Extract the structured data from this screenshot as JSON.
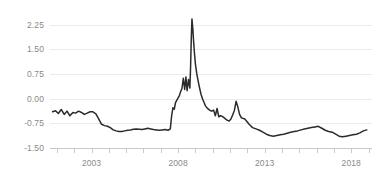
{
  "chart_data": {
    "type": "line",
    "title": "",
    "subtitle": "",
    "xlabel": "",
    "ylabel": "",
    "grid": true,
    "legend": false,
    "legend_position": "none",
    "background_color": "#ffffff",
    "series_color": "#2b2b2b",
    "grid_color": "#ebebeb",
    "axis_color": "#c9c9c9",
    "label_color": "#8a8a8a",
    "xlim": [
      2000.6,
      2019.2
    ],
    "ylim": [
      -1.5,
      2.45
    ],
    "yticks": [
      2.25,
      1.5,
      0.75,
      0,
      -0.75,
      -1.5
    ],
    "ytick_labels": [
      "2.25",
      "1.50",
      "0.75",
      "0.00",
      "-0.75",
      "-1.50"
    ],
    "xticks": [
      2001,
      2002,
      2003,
      2004,
      2005,
      2006,
      2007,
      2008,
      2009,
      2010,
      2011,
      2012,
      2013,
      2014,
      2015,
      2016,
      2017,
      2018,
      2019
    ],
    "xtick_labels": [
      "2003",
      "2008",
      "2013",
      "2018"
    ],
    "xtick_label_values": [
      2003,
      2008,
      2013,
      2018
    ],
    "series": [
      {
        "name": "spread",
        "x": [
          2000.75,
          2000.92,
          2001.08,
          2001.25,
          2001.42,
          2001.58,
          2001.75,
          2001.92,
          2002.08,
          2002.25,
          2002.42,
          2002.58,
          2002.75,
          2002.92,
          2003.08,
          2003.25,
          2003.42,
          2003.58,
          2003.75,
          2003.92,
          2004.08,
          2004.25,
          2004.42,
          2004.58,
          2004.75,
          2004.92,
          2005.08,
          2005.25,
          2005.42,
          2005.58,
          2005.75,
          2005.92,
          2006.08,
          2006.25,
          2006.42,
          2006.58,
          2006.75,
          2006.92,
          2007.08,
          2007.25,
          2007.42,
          2007.55,
          2007.62,
          2007.7,
          2007.78,
          2007.85,
          2007.92,
          2008.0,
          2008.08,
          2008.15,
          2008.22,
          2008.3,
          2008.38,
          2008.45,
          2008.52,
          2008.6,
          2008.68,
          2008.72,
          2008.76,
          2008.8,
          2008.85,
          2008.9,
          2008.95,
          2009.0,
          2009.08,
          2009.17,
          2009.25,
          2009.33,
          2009.42,
          2009.5,
          2009.58,
          2009.67,
          2009.75,
          2009.85,
          2009.95,
          2010.05,
          2010.15,
          2010.25,
          2010.35,
          2010.45,
          2010.55,
          2010.65,
          2010.75,
          2010.85,
          2010.95,
          2011.05,
          2011.15,
          2011.25,
          2011.35,
          2011.45,
          2011.55,
          2011.65,
          2011.75,
          2011.85,
          2011.95,
          2012.1,
          2012.3,
          2012.5,
          2012.7,
          2012.9,
          2013.1,
          2013.3,
          2013.5,
          2013.7,
          2013.9,
          2014.1,
          2014.3,
          2014.5,
          2014.7,
          2014.9,
          2015.1,
          2015.3,
          2015.5,
          2015.7,
          2015.9,
          2016.1,
          2016.3,
          2016.5,
          2016.7,
          2016.9,
          2017.1,
          2017.3,
          2017.5,
          2017.7,
          2017.9,
          2018.1,
          2018.3,
          2018.5,
          2018.7,
          2018.9
        ],
        "values": [
          -0.4,
          -0.37,
          -0.45,
          -0.33,
          -0.48,
          -0.38,
          -0.52,
          -0.42,
          -0.44,
          -0.38,
          -0.42,
          -0.48,
          -0.44,
          -0.4,
          -0.4,
          -0.46,
          -0.62,
          -0.78,
          -0.82,
          -0.84,
          -0.88,
          -0.95,
          -0.98,
          -1.0,
          -1.0,
          -0.98,
          -0.96,
          -0.95,
          -0.93,
          -0.92,
          -0.93,
          -0.94,
          -0.92,
          -0.9,
          -0.92,
          -0.94,
          -0.95,
          -0.96,
          -0.95,
          -0.94,
          -0.96,
          -0.92,
          -0.55,
          -0.28,
          -0.32,
          -0.12,
          -0.05,
          0.02,
          0.1,
          0.22,
          0.3,
          0.62,
          0.28,
          0.66,
          0.24,
          0.58,
          0.32,
          0.95,
          1.8,
          2.42,
          2.12,
          1.7,
          1.35,
          1.05,
          0.75,
          0.5,
          0.3,
          0.12,
          -0.02,
          -0.12,
          -0.22,
          -0.28,
          -0.32,
          -0.36,
          -0.38,
          -0.35,
          -0.52,
          -0.3,
          -0.55,
          -0.52,
          -0.54,
          -0.58,
          -0.62,
          -0.66,
          -0.68,
          -0.62,
          -0.5,
          -0.36,
          -0.08,
          -0.25,
          -0.48,
          -0.58,
          -0.6,
          -0.62,
          -0.68,
          -0.78,
          -0.88,
          -0.92,
          -0.96,
          -1.02,
          -1.08,
          -1.12,
          -1.14,
          -1.12,
          -1.1,
          -1.08,
          -1.05,
          -1.02,
          -1.0,
          -0.98,
          -0.95,
          -0.92,
          -0.9,
          -0.88,
          -0.86,
          -0.84,
          -0.9,
          -0.96,
          -1.0,
          -1.02,
          -1.08,
          -1.14,
          -1.16,
          -1.14,
          -1.12,
          -1.1,
          -1.08,
          -1.04,
          -0.98,
          -0.95
        ]
      }
    ]
  }
}
